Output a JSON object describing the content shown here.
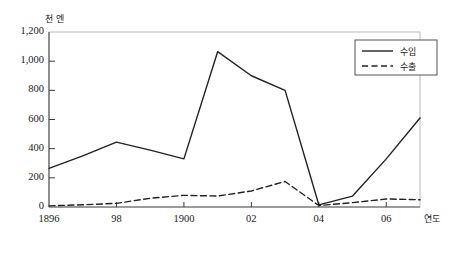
{
  "chart_data": {
    "type": "line",
    "title": "",
    "subtitle": "",
    "xlabel": "연도",
    "ylabel": "천 엔",
    "x": [
      1896,
      1897,
      1898,
      1899,
      1900,
      1901,
      1902,
      1903,
      1904,
      1905,
      1906,
      1907
    ],
    "xtick_values": [
      1896,
      1898,
      1900,
      1902,
      1904,
      1906
    ],
    "xtick_labels": [
      "1896",
      "98",
      "1900",
      "02",
      "04",
      "06"
    ],
    "ytick_values": [
      0,
      200,
      400,
      600,
      800,
      1000,
      1200
    ],
    "ytick_labels": [
      "0",
      "200",
      "400",
      "600",
      "800",
      "1,000",
      "1,200"
    ],
    "xlim": [
      1896,
      1907
    ],
    "ylim": [
      0,
      1200
    ],
    "grid": false,
    "legend_position": "top-right",
    "series": [
      {
        "name": "수입",
        "style": "solid",
        "color": "#222222",
        "values": [
          265,
          350,
          445,
          390,
          330,
          1065,
          900,
          800,
          15,
          75,
          330,
          610
        ]
      },
      {
        "name": "수출",
        "style": "dashed",
        "color": "#222222",
        "values": [
          8,
          15,
          25,
          60,
          80,
          75,
          110,
          175,
          10,
          30,
          55,
          50
        ]
      }
    ]
  },
  "axis": {
    "unit_label": "천 엔",
    "x_axis_title": "연도"
  },
  "legend": {
    "items": [
      {
        "label": "수입",
        "style": "solid"
      },
      {
        "label": "수출",
        "style": "dashed"
      }
    ]
  }
}
